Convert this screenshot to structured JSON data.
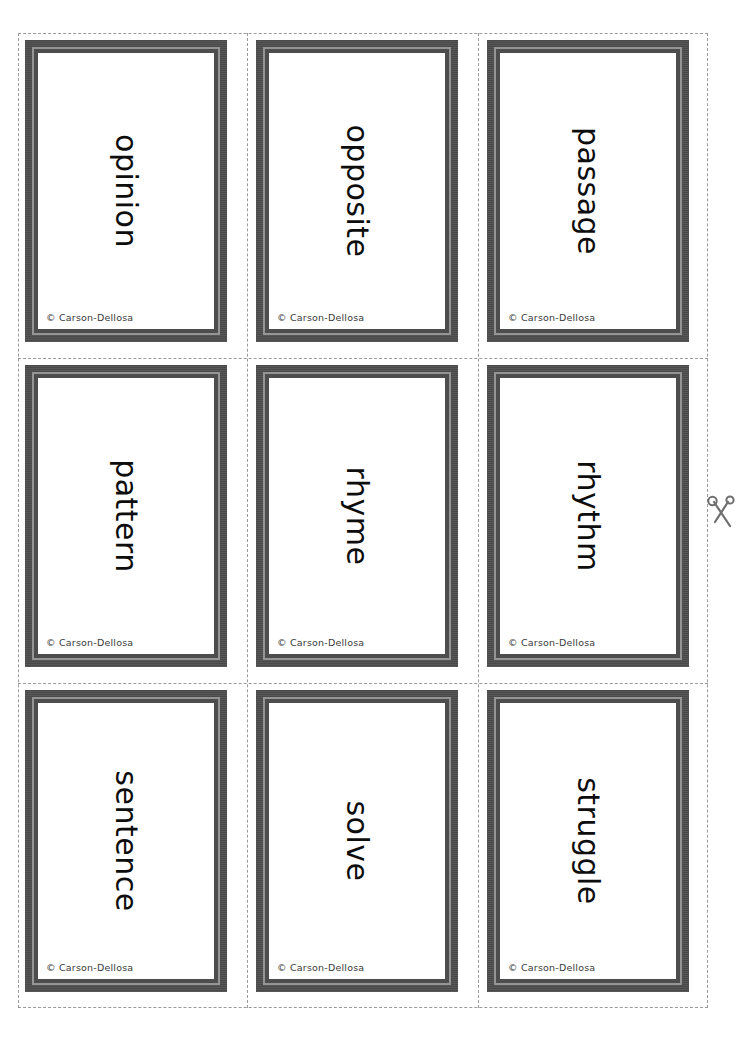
{
  "page": {
    "background_color": "#ffffff",
    "cut_line_color": "#9b9b9b",
    "frame_color": "#4d4d4d",
    "frame_inner_line_color": "#959595",
    "word_color": "#0d0d0d",
    "credit_color": "#3a3a3a"
  },
  "markers": {
    "scissors_icon": "scissors-icon"
  },
  "grid": {
    "columns": 3,
    "rows": 3
  },
  "cards": [
    {
      "word": "opinion",
      "credit": "© Carson-Dellosa",
      "row": 1,
      "col": 1
    },
    {
      "word": "opposite",
      "credit": "© Carson-Dellosa",
      "row": 1,
      "col": 2
    },
    {
      "word": "passage",
      "credit": "© Carson-Dellosa",
      "row": 1,
      "col": 3
    },
    {
      "word": "pattern",
      "credit": "© Carson-Dellosa",
      "row": 2,
      "col": 1
    },
    {
      "word": "rhyme",
      "credit": "© Carson-Dellosa",
      "row": 2,
      "col": 2
    },
    {
      "word": "rhythm",
      "credit": "© Carson-Dellosa",
      "row": 2,
      "col": 3
    },
    {
      "word": "sentence",
      "credit": "© Carson-Dellosa",
      "row": 3,
      "col": 1
    },
    {
      "word": "solve",
      "credit": "© Carson-Dellosa",
      "row": 3,
      "col": 2
    },
    {
      "word": "struggle",
      "credit": "© Carson-Dellosa",
      "row": 3,
      "col": 3
    }
  ]
}
